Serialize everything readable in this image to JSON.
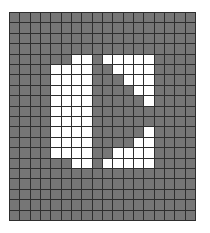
{
  "canvas": {
    "cols": 18,
    "rows": 20,
    "off_color": "#767676",
    "on_color": "#ffffff",
    "grid_line_color": "#2e2e2e"
  },
  "icon": {
    "name": "pixel-icon-bracket-arrow",
    "on_cells": {
      "4": [
        6,
        7,
        9,
        10,
        11,
        12,
        13
      ],
      "5": [
        4,
        5,
        6,
        7,
        10,
        11,
        12,
        13
      ],
      "6": [
        4,
        5,
        6,
        7,
        11,
        12,
        13
      ],
      "7": [
        4,
        5,
        6,
        7,
        12,
        13
      ],
      "8": [
        4,
        5,
        6,
        7,
        13
      ],
      "9": [
        4,
        5,
        6,
        7
      ],
      "10": [
        4,
        5,
        6,
        7
      ],
      "11": [
        4,
        5,
        6,
        7,
        13
      ],
      "12": [
        4,
        5,
        6,
        7,
        12,
        13
      ],
      "13": [
        4,
        5,
        6,
        7,
        10,
        11,
        12,
        13
      ],
      "14": [
        6,
        7,
        9,
        10,
        11,
        12,
        13
      ]
    }
  }
}
